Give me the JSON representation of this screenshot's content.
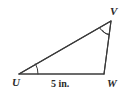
{
  "figure": {
    "kind": "triangle-diagram",
    "shape_name": "triangle-UVW",
    "stroke_color": "#3a3a3a",
    "fill_color": "#ffffff",
    "background_color": "#ffffff",
    "vertices": [
      {
        "name": "U",
        "label": "U",
        "x": 19,
        "y": 74
      },
      {
        "name": "V",
        "label": "V",
        "x": 111,
        "y": 21
      },
      {
        "name": "W",
        "label": "W",
        "x": 104,
        "y": 74
      }
    ],
    "sides": [
      {
        "name": "UW",
        "from": "U",
        "to": "W",
        "label": "5 in."
      },
      {
        "name": "UV",
        "from": "U",
        "to": "V",
        "label": ""
      },
      {
        "name": "VW",
        "from": "V",
        "to": "W",
        "label": ""
      }
    ],
    "angle_marks": [
      {
        "at": "U",
        "arcs": 1
      },
      {
        "at": "V",
        "arcs": 2
      }
    ],
    "labels": {
      "vertex_u": "U",
      "vertex_v": "V",
      "vertex_w": "W",
      "side_uw": "5 in."
    }
  }
}
